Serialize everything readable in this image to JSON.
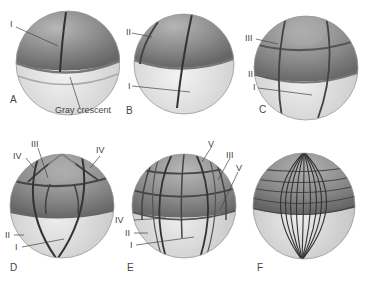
{
  "figure": {
    "panels": [
      {
        "id": "A",
        "label": "A",
        "cleavage_labels": [
          "I"
        ],
        "annotation": "Gray crescent"
      },
      {
        "id": "B",
        "label": "B",
        "cleavage_labels": [
          "II",
          "I"
        ]
      },
      {
        "id": "C",
        "label": "C",
        "cleavage_labels": [
          "III",
          "II",
          "I"
        ]
      },
      {
        "id": "D",
        "label": "D",
        "cleavage_labels": [
          "III",
          "IV",
          "IV",
          "II",
          "I"
        ]
      },
      {
        "id": "E",
        "label": "E",
        "cleavage_labels": [
          "V",
          "III",
          "V",
          "IV",
          "II",
          "I"
        ]
      },
      {
        "id": "F",
        "label": "F",
        "cleavage_labels": []
      }
    ]
  },
  "colors": {
    "animal_pole": "#8a8a8a",
    "vegetal_pole": "#e4e4e4",
    "furrow": "#3a3a3a",
    "label_text": "#444444",
    "background": "#ffffff"
  }
}
